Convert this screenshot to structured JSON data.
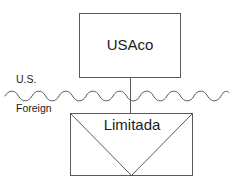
{
  "diagram": {
    "type": "ownership-structure-diagram",
    "background_color": "#ffffff",
    "line_color": "#5a5a5a",
    "text_color": "#1b1b1b",
    "entities": [
      {
        "id": "usaco",
        "label": "USAco",
        "shape": "rectangle",
        "jurisdiction": "U.S.",
        "x": 79,
        "y": 13,
        "width": 102,
        "height": 65
      },
      {
        "id": "limitada",
        "label": "Limitada",
        "shape": "rectangle-with-v",
        "jurisdiction": "Foreign",
        "x": 70,
        "y": 113,
        "width": 123,
        "height": 63
      }
    ],
    "jurisdiction_labels": [
      {
        "id": "us",
        "label": "U.S.",
        "x": 16,
        "y": 80
      },
      {
        "id": "foreign",
        "label": "Foreign",
        "x": 16,
        "y": 109
      }
    ],
    "border": {
      "id": "national-border",
      "style": "wavy",
      "y": 96,
      "x_start": 5,
      "x_end": 229,
      "period": 27,
      "amplitude": 4
    },
    "connector": {
      "id": "ownership-connector",
      "from": "usaco",
      "to": "limitada",
      "x": 130,
      "y_start": 78,
      "y_end": 113
    }
  }
}
